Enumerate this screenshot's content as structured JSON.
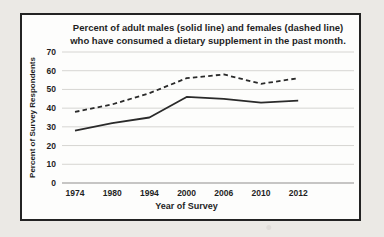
{
  "chart_data": {
    "type": "line",
    "title_line1": "Percent of adult males (solid line) and females (dashed line)",
    "title_line2": "who have consumed a dietary supplement in the past month.",
    "xlabel": "Year of Survey",
    "ylabel": "Percent of Survey Respondents",
    "categories": [
      "1974",
      "1980",
      "1994",
      "2000",
      "2006",
      "2010",
      "2012"
    ],
    "series": [
      {
        "name": "adult males (solid line)",
        "line_style": "solid",
        "values": [
          28,
          32,
          35,
          46,
          45,
          43,
          44
        ]
      },
      {
        "name": "adult females (dashed line)",
        "line_style": "dashed",
        "values": [
          38,
          42,
          48,
          56,
          58,
          53,
          56
        ]
      }
    ],
    "ylim": [
      0,
      70
    ],
    "ytick_step": 10,
    "grid": true,
    "legend_position": "none",
    "line_color": "#2a2a2a",
    "grid_color": "#d6d5d2",
    "axis_color": "#8f8e8b",
    "text_color": "#1f1f1f"
  }
}
